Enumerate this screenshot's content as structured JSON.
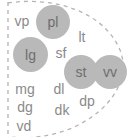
{
  "diagram": {
    "type": "cluster-scatter-labels",
    "background_color": "#ffffff",
    "boundary": {
      "name": "dashed-cluster-boundary",
      "style": "dashed",
      "color": "#b5b5b5",
      "shape": "open-leaf-arc-with-left-vertical-edge"
    },
    "plain_label_color": "#8a8a8a",
    "circle_fill_color": "#b9b9b9",
    "circle_label_color": "#6e6e6e",
    "nodes": [
      {
        "label": "vp",
        "circled": false,
        "x": 10,
        "y": 12,
        "w": 24,
        "h": 18,
        "font_size": 14
      },
      {
        "label": "pl",
        "circled": true,
        "x": 36,
        "y": 5,
        "w": 34,
        "h": 34,
        "font_size": 14
      },
      {
        "label": "lt",
        "circled": false,
        "x": 73,
        "y": 28,
        "w": 18,
        "h": 18,
        "font_size": 14
      },
      {
        "label": "lg",
        "circled": true,
        "x": 13,
        "y": 37,
        "w": 35,
        "h": 35,
        "font_size": 14
      },
      {
        "label": "sf",
        "circled": false,
        "x": 51,
        "y": 44,
        "w": 20,
        "h": 18,
        "font_size": 14
      },
      {
        "label": "st",
        "circled": true,
        "x": 64,
        "y": 55,
        "w": 34,
        "h": 34,
        "font_size": 14
      },
      {
        "label": "vv",
        "circled": true,
        "x": 93,
        "y": 55,
        "w": 34,
        "h": 34,
        "font_size": 14
      },
      {
        "label": "mg",
        "circled": false,
        "x": 11,
        "y": 80,
        "w": 28,
        "h": 18,
        "font_size": 14
      },
      {
        "label": "dl",
        "circled": false,
        "x": 50,
        "y": 80,
        "w": 18,
        "h": 18,
        "font_size": 14
      },
      {
        "label": "dg",
        "circled": false,
        "x": 12,
        "y": 98,
        "w": 26,
        "h": 18,
        "font_size": 14
      },
      {
        "label": "dk",
        "circled": false,
        "x": 50,
        "y": 101,
        "w": 24,
        "h": 18,
        "font_size": 14
      },
      {
        "label": "dp",
        "circled": false,
        "x": 74,
        "y": 92,
        "w": 26,
        "h": 18,
        "font_size": 14
      },
      {
        "label": "vd",
        "circled": false,
        "x": 12,
        "y": 117,
        "w": 24,
        "h": 18,
        "font_size": 14
      }
    ]
  }
}
